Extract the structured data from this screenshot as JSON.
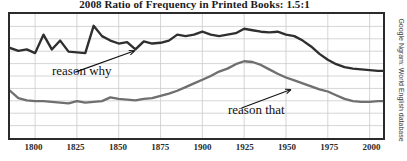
{
  "chart_data": {
    "type": "line",
    "title": "2008 Ratio of Frequency in Printed Books: 1.5:1",
    "xlabel": "",
    "ylabel": "",
    "grid": true,
    "legend_position": "inline-annotations",
    "source_credit": "Google Ngram: World English database",
    "xlim": [
      1785,
      2008
    ],
    "xticks": [
      1800,
      1825,
      1850,
      1875,
      1900,
      1925,
      1950,
      1975,
      2000
    ],
    "ytick_count": 10,
    "annotations": [
      {
        "text": "reason why",
        "series": "reason why",
        "points_to_year": 1915
      },
      {
        "text": "reason that",
        "series": "reason that",
        "points_to_year": 1975
      }
    ],
    "series": [
      {
        "name": "reason why",
        "color": "#2f2f2f",
        "x": [
          1785,
          1790,
          1795,
          1800,
          1805,
          1810,
          1815,
          1820,
          1825,
          1830,
          1835,
          1840,
          1845,
          1850,
          1855,
          1860,
          1865,
          1870,
          1875,
          1880,
          1885,
          1890,
          1895,
          1900,
          1905,
          1910,
          1915,
          1920,
          1925,
          1930,
          1935,
          1940,
          1945,
          1950,
          1955,
          1960,
          1965,
          1970,
          1975,
          1980,
          1985,
          1990,
          1995,
          2000,
          2005,
          2008
        ],
        "values": [
          0.61,
          0.59,
          0.6,
          0.575,
          0.7,
          0.6,
          0.66,
          0.585,
          0.58,
          0.575,
          0.76,
          0.69,
          0.66,
          0.64,
          0.65,
          0.6,
          0.655,
          0.64,
          0.645,
          0.66,
          0.7,
          0.69,
          0.7,
          0.72,
          0.7,
          0.69,
          0.7,
          0.71,
          0.74,
          0.73,
          0.72,
          0.715,
          0.72,
          0.7,
          0.69,
          0.66,
          0.62,
          0.57,
          0.53,
          0.5,
          0.48,
          0.47,
          0.465,
          0.46,
          0.455,
          0.455
        ]
      },
      {
        "name": "reason that",
        "color": "#6f6f6f",
        "x": [
          1785,
          1790,
          1795,
          1800,
          1805,
          1810,
          1815,
          1820,
          1825,
          1830,
          1835,
          1840,
          1845,
          1850,
          1855,
          1860,
          1865,
          1870,
          1875,
          1880,
          1885,
          1890,
          1895,
          1900,
          1905,
          1910,
          1915,
          1920,
          1925,
          1930,
          1935,
          1940,
          1945,
          1950,
          1955,
          1960,
          1965,
          1970,
          1975,
          1980,
          1985,
          1990,
          1995,
          2000,
          2005,
          2008
        ],
        "values": [
          0.32,
          0.27,
          0.255,
          0.25,
          0.25,
          0.245,
          0.24,
          0.235,
          0.25,
          0.24,
          0.245,
          0.25,
          0.275,
          0.265,
          0.26,
          0.255,
          0.265,
          0.27,
          0.285,
          0.3,
          0.32,
          0.345,
          0.37,
          0.395,
          0.42,
          0.45,
          0.47,
          0.5,
          0.52,
          0.515,
          0.495,
          0.465,
          0.435,
          0.41,
          0.39,
          0.37,
          0.35,
          0.33,
          0.315,
          0.29,
          0.265,
          0.25,
          0.245,
          0.245,
          0.25,
          0.25
        ]
      }
    ]
  }
}
